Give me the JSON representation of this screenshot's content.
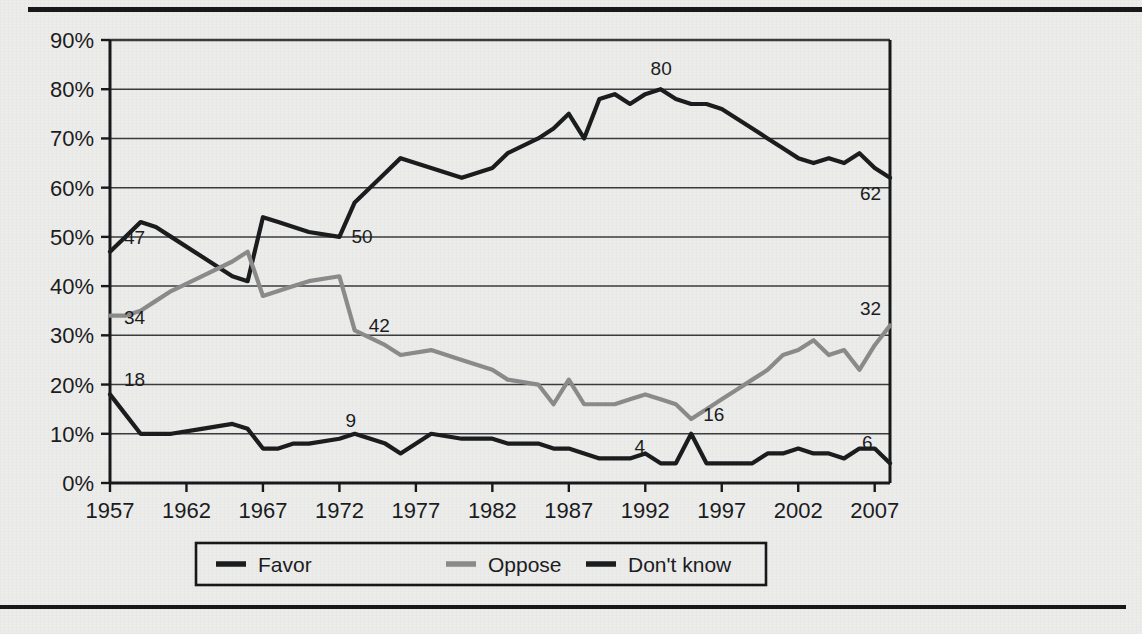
{
  "page": {
    "background_color": "#ececeb",
    "rule_color": "#17181a"
  },
  "chart_data": {
    "type": "line",
    "title": "",
    "subtitle": "",
    "xlabel": "",
    "ylabel": "",
    "xlim": [
      1957,
      2008
    ],
    "ylim": [
      0,
      90
    ],
    "grid": true,
    "grid_axis": "y",
    "legend_position": "bottom",
    "y_ticks": [
      "0%",
      "10%",
      "20%",
      "30%",
      "40%",
      "50%",
      "60%",
      "70%",
      "80%",
      "90%"
    ],
    "y_tick_values": [
      0,
      10,
      20,
      30,
      40,
      50,
      60,
      70,
      80,
      90
    ],
    "x_ticks": [
      "1957",
      "1962",
      "1967",
      "1972",
      "1977",
      "1982",
      "1987",
      "1992",
      "1997",
      "2002",
      "2007"
    ],
    "x_tick_values": [
      1957,
      1962,
      1967,
      1972,
      1977,
      1982,
      1987,
      1992,
      1997,
      2002,
      2007
    ],
    "series": [
      {
        "name": "Favor",
        "color": "#1b1c1e",
        "width": 4.2,
        "x": [
          1957,
          1958,
          1959,
          1960,
          1961,
          1963,
          1965,
          1966,
          1967,
          1968,
          1969,
          1970,
          1972,
          1973,
          1975,
          1976,
          1978,
          1980,
          1982,
          1983,
          1985,
          1986,
          1987,
          1988,
          1989,
          1990,
          1991,
          1992,
          1993,
          1994,
          1995,
          1996,
          1997,
          1998,
          1999,
          2000,
          2001,
          2002,
          2003,
          2004,
          2005,
          2006,
          2007,
          2008
        ],
        "y": [
          47,
          50,
          53,
          52,
          50,
          46,
          42,
          41,
          54,
          53,
          52,
          51,
          50,
          57,
          63,
          66,
          64,
          62,
          64,
          67,
          70,
          72,
          75,
          70,
          78,
          79,
          77,
          79,
          80,
          78,
          77,
          77,
          76,
          74,
          72,
          70,
          68,
          66,
          65,
          66,
          65,
          67,
          64,
          62
        ],
        "labels": [
          {
            "x": 1957,
            "text": "47"
          },
          {
            "x": 1972,
            "text": "50"
          },
          {
            "x": 1993,
            "text": "80"
          },
          {
            "x": 2008,
            "text": "62"
          }
        ]
      },
      {
        "name": "Oppose",
        "color": "#8a8a8a",
        "width": 4.2,
        "x": [
          1957,
          1958,
          1959,
          1960,
          1961,
          1963,
          1965,
          1966,
          1967,
          1968,
          1969,
          1970,
          1972,
          1973,
          1975,
          1976,
          1978,
          1980,
          1982,
          1983,
          1985,
          1986,
          1987,
          1988,
          1989,
          1990,
          1991,
          1992,
          1993,
          1994,
          1995,
          1996,
          1997,
          1998,
          1999,
          2000,
          2001,
          2002,
          2003,
          2004,
          2005,
          2006,
          2007,
          2008
        ],
        "y": [
          34,
          34,
          35,
          37,
          39,
          42,
          45,
          47,
          38,
          39,
          40,
          41,
          42,
          31,
          28,
          26,
          27,
          25,
          23,
          21,
          20,
          16,
          21,
          16,
          16,
          16,
          17,
          18,
          17,
          16,
          13,
          15,
          17,
          19,
          21,
          23,
          26,
          27,
          29,
          26,
          27,
          23,
          28,
          32
        ],
        "labels": [
          {
            "x": 1957,
            "text": "34"
          },
          {
            "x": 1973,
            "text": "42"
          },
          {
            "x": 1995,
            "text": "16"
          },
          {
            "x": 2008,
            "text": "32"
          }
        ]
      },
      {
        "name": "Don't know",
        "color": "#1b1c1e",
        "width": 4.2,
        "x": [
          1957,
          1958,
          1959,
          1960,
          1961,
          1963,
          1965,
          1966,
          1967,
          1968,
          1969,
          1970,
          1972,
          1973,
          1975,
          1976,
          1978,
          1980,
          1982,
          1983,
          1985,
          1986,
          1987,
          1988,
          1989,
          1990,
          1991,
          1992,
          1993,
          1994,
          1995,
          1996,
          1997,
          1998,
          1999,
          2000,
          2001,
          2002,
          2003,
          2004,
          2005,
          2006,
          2007,
          2008
        ],
        "y": [
          18,
          14,
          10,
          10,
          10,
          11,
          12,
          11,
          7,
          7,
          8,
          8,
          9,
          10,
          8,
          6,
          10,
          9,
          9,
          8,
          8,
          7,
          7,
          6,
          5,
          5,
          5,
          6,
          4,
          4,
          10,
          4,
          4,
          4,
          4,
          6,
          6,
          7,
          6,
          6,
          5,
          7,
          7,
          4
        ],
        "labels": [
          {
            "x": 1957,
            "text": "18"
          },
          {
            "x": 1972,
            "text": "9"
          },
          {
            "x": 1993,
            "text": "4"
          },
          {
            "x": 2008,
            "text": "6"
          }
        ]
      }
    ],
    "legend": [
      {
        "label": "Favor",
        "color": "#1b1c1e"
      },
      {
        "label": "Oppose",
        "color": "#8a8a8a"
      },
      {
        "label": "Don't know",
        "color": "#1b1c1e"
      }
    ]
  }
}
